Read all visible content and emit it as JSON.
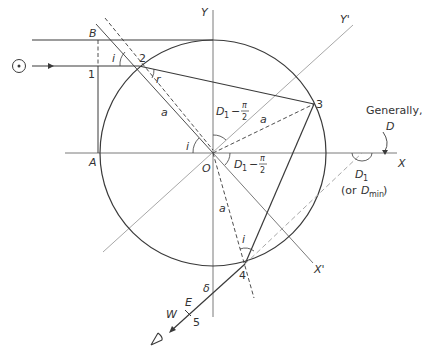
{
  "figure": {
    "colors": {
      "dark_line": "#3a3a3a",
      "axis_line": "#7a7a7a",
      "light_line": "#a8a8a8",
      "text": "#333333"
    }
  },
  "labels": {
    "axis_y": "Y",
    "axis_y_prime": "Y'",
    "axis_x": "X",
    "axis_x_prime": "X'",
    "point_A": "A",
    "point_B": "B",
    "point_O": "O",
    "point_1": "1",
    "point_2": "2",
    "point_3": "3",
    "point_4": "4",
    "point_5": "5",
    "angle_i_top": "i",
    "angle_r": "r",
    "angle_i_center": "i",
    "angle_i_bottom": "i",
    "radius_a_upper": "a",
    "radius_a_right": "a",
    "radius_a_lower": "a",
    "angle_upper_D": "D",
    "angle_upper_sub": "1",
    "angle_upper_minus": "−",
    "angle_upper_pi": "π",
    "angle_upper_2": "2",
    "angle_lower_D": "D",
    "angle_lower_sub": "1",
    "angle_lower_minus": "−",
    "angle_lower_pi": "π",
    "angle_lower_2": "2",
    "generally": "Generally,",
    "generally_D": "D",
    "D1_main": "D",
    "D1_sub": "1",
    "or_dmin_prefix": "(or ",
    "or_dmin_D": "D",
    "or_dmin_sub": "min",
    "or_dmin_suffix": ")",
    "delta": "δ",
    "east": "E",
    "west": "W"
  },
  "icons": {
    "sun": "sun-symbol",
    "eye": "observer-eye"
  }
}
